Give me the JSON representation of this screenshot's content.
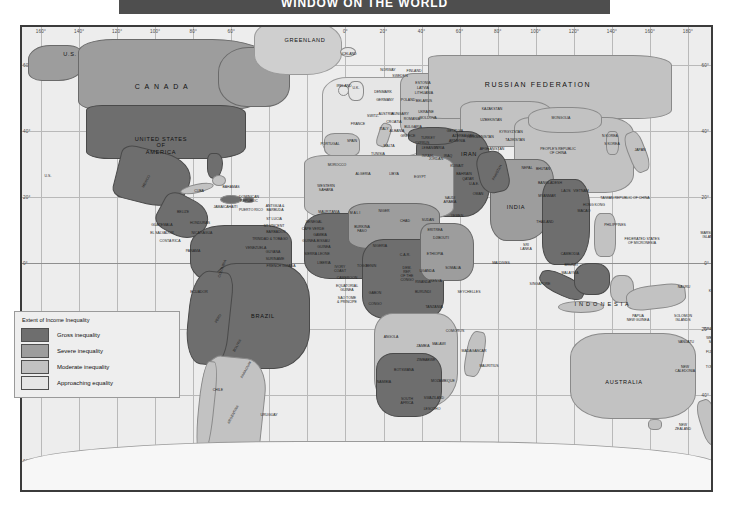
{
  "header": {
    "title": "WINDOW ON THE WORLD"
  },
  "legend": {
    "title": "Extent of Income Inequality",
    "items": [
      {
        "label": "Gross inequality",
        "color": "#6e6e6e"
      },
      {
        "label": "Severe inequality",
        "color": "#9d9d9d"
      },
      {
        "label": "Moderate inequality",
        "color": "#c2c2c2"
      },
      {
        "label": "Approaching equality",
        "color": "#e6e6e6"
      }
    ]
  },
  "graticule": {
    "longitudes": [
      "160°",
      "140°",
      "120°",
      "100°",
      "80°",
      "60°",
      "40°",
      "20°",
      "0°",
      "20°",
      "40°",
      "60°",
      "80°",
      "100°",
      "120°",
      "140°",
      "160°",
      "180°"
    ],
    "latitudes_left": [
      "60°",
      "40°",
      "20°",
      "0°",
      "20°",
      "40°",
      "60°"
    ],
    "latitudes_right": [
      "60°",
      "40°",
      "20°",
      "0°",
      "20°",
      "40°",
      "60°"
    ]
  },
  "map": {
    "labels": [
      {
        "t": "U.S.",
        "x": 48,
        "y": 27,
        "s": "mid"
      },
      {
        "t": "C A N A D A",
        "x": 140,
        "y": 60,
        "s": "big"
      },
      {
        "t": "GREENLAND",
        "x": 283,
        "y": 13,
        "s": "mid"
      },
      {
        "t": "ICELAND",
        "x": 327,
        "y": 28,
        "s": "tiny"
      },
      {
        "t": "UNITED STATES\nOF\nAMERICA",
        "x": 139,
        "y": 118,
        "s": "mid"
      },
      {
        "t": "U.S.",
        "x": 26,
        "y": 150,
        "s": "tiny"
      },
      {
        "t": "MEXICO",
        "x": 125,
        "y": 155,
        "s": "rot"
      },
      {
        "t": "CUBA",
        "x": 177,
        "y": 165,
        "s": "tiny"
      },
      {
        "t": "BAHAMAS",
        "x": 209,
        "y": 161,
        "s": "tiny"
      },
      {
        "t": "DOMINICAN\nREPUBLIC",
        "x": 227,
        "y": 173,
        "s": "tiny"
      },
      {
        "t": "PUERTO RICO",
        "x": 229,
        "y": 184,
        "s": "tiny"
      },
      {
        "t": "JAMAICA",
        "x": 199,
        "y": 181,
        "s": "tiny"
      },
      {
        "t": "HAITI",
        "x": 211,
        "y": 181,
        "s": "tiny"
      },
      {
        "t": "ANTIGUA &\nBARBUDA",
        "x": 253,
        "y": 182,
        "s": "tiny"
      },
      {
        "t": "BELIZE",
        "x": 161,
        "y": 186,
        "s": "tiny"
      },
      {
        "t": "GUATEMALA",
        "x": 140,
        "y": 199,
        "s": "tiny"
      },
      {
        "t": "HONDURAS",
        "x": 178,
        "y": 197,
        "s": "tiny"
      },
      {
        "t": "EL SALVADOR",
        "x": 140,
        "y": 207,
        "s": "tiny"
      },
      {
        "t": "NICARAGUA",
        "x": 180,
        "y": 207,
        "s": "tiny"
      },
      {
        "t": "COSTA RICA",
        "x": 148,
        "y": 215,
        "s": "tiny"
      },
      {
        "t": "ST LUCIA",
        "x": 252,
        "y": 193,
        "s": "tiny"
      },
      {
        "t": "ST VINCENT",
        "x": 252,
        "y": 200,
        "s": "tiny"
      },
      {
        "t": "BARBADOS",
        "x": 254,
        "y": 206,
        "s": "tiny"
      },
      {
        "t": "TRINIDAD & TOBAGO",
        "x": 248,
        "y": 213,
        "s": "tiny"
      },
      {
        "t": "PANAMA",
        "x": 171,
        "y": 225,
        "s": "tiny"
      },
      {
        "t": "VENEZUELA",
        "x": 234,
        "y": 222,
        "s": "tiny"
      },
      {
        "t": "GUYANA",
        "x": 251,
        "y": 226,
        "s": "tiny"
      },
      {
        "t": "SURINAME",
        "x": 253,
        "y": 233,
        "s": "tiny"
      },
      {
        "t": "FRENCH GUIANA",
        "x": 259,
        "y": 240,
        "s": "tiny"
      },
      {
        "t": "COLOMBIA",
        "x": 201,
        "y": 242,
        "s": "rot2"
      },
      {
        "t": "ECUADOR",
        "x": 177,
        "y": 266,
        "s": "tiny"
      },
      {
        "t": "PERU",
        "x": 197,
        "y": 292,
        "s": "rot"
      },
      {
        "t": "BRAZIL",
        "x": 241,
        "y": 289,
        "s": "mid"
      },
      {
        "t": "BOLIVIA",
        "x": 216,
        "y": 319,
        "s": "rot"
      },
      {
        "t": "PARAGUAY",
        "x": 225,
        "y": 343,
        "s": "rot"
      },
      {
        "t": "CHILE",
        "x": 196,
        "y": 364,
        "s": "tiny"
      },
      {
        "t": "ARGENTINA",
        "x": 212,
        "y": 388,
        "s": "rot"
      },
      {
        "t": "URUGUAY",
        "x": 247,
        "y": 389,
        "s": "tiny"
      },
      {
        "t": "PORTUGAL",
        "x": 308,
        "y": 118,
        "s": "tiny"
      },
      {
        "t": "SPAIN",
        "x": 330,
        "y": 115,
        "s": "tiny"
      },
      {
        "t": "FRANCE",
        "x": 336,
        "y": 98,
        "s": "tiny"
      },
      {
        "t": "IRELAND",
        "x": 322,
        "y": 60,
        "s": "tiny"
      },
      {
        "t": "U.K.",
        "x": 334,
        "y": 62,
        "s": "tiny"
      },
      {
        "t": "NORWAY",
        "x": 366,
        "y": 44,
        "s": "tiny"
      },
      {
        "t": "SWEDEN",
        "x": 378,
        "y": 50,
        "s": "tiny"
      },
      {
        "t": "FINLAND",
        "x": 392,
        "y": 45,
        "s": "tiny"
      },
      {
        "t": "ESTONIA",
        "x": 401,
        "y": 57,
        "s": "tiny"
      },
      {
        "t": "LATVIA",
        "x": 401,
        "y": 62,
        "s": "tiny"
      },
      {
        "t": "LITHUANIA",
        "x": 402,
        "y": 67,
        "s": "tiny"
      },
      {
        "t": "DENMARK",
        "x": 361,
        "y": 66,
        "s": "tiny"
      },
      {
        "t": "POLAND",
        "x": 386,
        "y": 74,
        "s": "tiny"
      },
      {
        "t": "GERMANY",
        "x": 363,
        "y": 74,
        "s": "tiny"
      },
      {
        "t": "BELARUS",
        "x": 402,
        "y": 75,
        "s": "tiny"
      },
      {
        "t": "UKRAINE",
        "x": 404,
        "y": 86,
        "s": "tiny"
      },
      {
        "t": "MOLDOVA",
        "x": 406,
        "y": 92,
        "s": "tiny"
      },
      {
        "t": "ROMANIA",
        "x": 390,
        "y": 93,
        "s": "tiny"
      },
      {
        "t": "HUNGARY",
        "x": 378,
        "y": 88,
        "s": "tiny"
      },
      {
        "t": "AUSTRIA",
        "x": 364,
        "y": 88,
        "s": "tiny"
      },
      {
        "t": "SWITZ.",
        "x": 351,
        "y": 90,
        "s": "tiny"
      },
      {
        "t": "ITALY",
        "x": 362,
        "y": 103,
        "s": "tiny"
      },
      {
        "t": "CROATIA",
        "x": 372,
        "y": 96,
        "s": "tiny"
      },
      {
        "t": "BULGARIA",
        "x": 391,
        "y": 101,
        "s": "tiny"
      },
      {
        "t": "GREECE",
        "x": 386,
        "y": 110,
        "s": "tiny"
      },
      {
        "t": "ALBANIA",
        "x": 375,
        "y": 105,
        "s": "tiny"
      },
      {
        "t": "MALTA",
        "x": 367,
        "y": 120,
        "s": "tiny"
      },
      {
        "t": "CYPRUS",
        "x": 400,
        "y": 117,
        "s": "tiny"
      },
      {
        "t": "TURKEY",
        "x": 406,
        "y": 112,
        "s": "tiny"
      },
      {
        "t": "SYRIA",
        "x": 417,
        "y": 122,
        "s": "tiny"
      },
      {
        "t": "LEBANON",
        "x": 408,
        "y": 122,
        "s": "tiny"
      },
      {
        "t": "ISRAEL",
        "x": 406,
        "y": 130,
        "s": "tiny"
      },
      {
        "t": "JORDAN",
        "x": 414,
        "y": 133,
        "s": "tiny"
      },
      {
        "t": "IRAQ",
        "x": 426,
        "y": 130,
        "s": "tiny"
      },
      {
        "t": "IRAN",
        "x": 447,
        "y": 127,
        "s": "mid"
      },
      {
        "t": "KUWAIT",
        "x": 435,
        "y": 140,
        "s": "tiny"
      },
      {
        "t": "BAHRAIN",
        "x": 442,
        "y": 148,
        "s": "tiny"
      },
      {
        "t": "QATAR",
        "x": 446,
        "y": 153,
        "s": "tiny"
      },
      {
        "t": "U.A.E.",
        "x": 452,
        "y": 158,
        "s": "tiny"
      },
      {
        "t": "SAUDI\nARABIA",
        "x": 428,
        "y": 174,
        "s": "tiny"
      },
      {
        "t": "OMAN",
        "x": 456,
        "y": 168,
        "s": "tiny"
      },
      {
        "t": "YEMEN",
        "x": 435,
        "y": 190,
        "s": "tiny"
      },
      {
        "t": "WESTERN\nSAHARA",
        "x": 304,
        "y": 162,
        "s": "tiny"
      },
      {
        "t": "ALGERIA",
        "x": 341,
        "y": 148,
        "s": "tiny"
      },
      {
        "t": "LIBYA",
        "x": 372,
        "y": 148,
        "s": "tiny"
      },
      {
        "t": "EGYPT",
        "x": 398,
        "y": 151,
        "s": "tiny"
      },
      {
        "t": "MOROCCO",
        "x": 315,
        "y": 139,
        "s": "tiny"
      },
      {
        "t": "TUNISIA",
        "x": 356,
        "y": 128,
        "s": "tiny"
      },
      {
        "t": "MAURITANIA",
        "x": 307,
        "y": 186,
        "s": "tiny"
      },
      {
        "t": "SENEGAL",
        "x": 292,
        "y": 196,
        "s": "tiny"
      },
      {
        "t": "CAPE VERDE",
        "x": 291,
        "y": 203,
        "s": "tiny"
      },
      {
        "t": "GAMBIA",
        "x": 298,
        "y": 209,
        "s": "tiny"
      },
      {
        "t": "GUINEA-BISSAU",
        "x": 294,
        "y": 215,
        "s": "tiny"
      },
      {
        "t": "GUINEA",
        "x": 302,
        "y": 221,
        "s": "tiny"
      },
      {
        "t": "SIERRA LEONE",
        "x": 295,
        "y": 228,
        "s": "tiny"
      },
      {
        "t": "LIBERIA",
        "x": 302,
        "y": 237,
        "s": "tiny"
      },
      {
        "t": "IVORY\nCOAST",
        "x": 318,
        "y": 243,
        "s": "tiny"
      },
      {
        "t": "M A L I",
        "x": 333,
        "y": 187,
        "s": "tiny"
      },
      {
        "t": "NIGER",
        "x": 362,
        "y": 185,
        "s": "tiny"
      },
      {
        "t": "BURKINA\nFASO",
        "x": 340,
        "y": 203,
        "s": "tiny"
      },
      {
        "t": "TOGO",
        "x": 340,
        "y": 240,
        "s": "tiny"
      },
      {
        "t": "BENIN",
        "x": 349,
        "y": 240,
        "s": "tiny"
      },
      {
        "t": "NIGERIA",
        "x": 358,
        "y": 220,
        "s": "tiny"
      },
      {
        "t": "CHAD",
        "x": 383,
        "y": 195,
        "s": "tiny"
      },
      {
        "t": "SUDAN",
        "x": 406,
        "y": 194,
        "s": "tiny"
      },
      {
        "t": "ERITREA",
        "x": 413,
        "y": 204,
        "s": "tiny"
      },
      {
        "t": "DJIBOUTI",
        "x": 419,
        "y": 212,
        "s": "tiny"
      },
      {
        "t": "ETHIOPIA",
        "x": 413,
        "y": 228,
        "s": "tiny"
      },
      {
        "t": "SOMALIA",
        "x": 431,
        "y": 242,
        "s": "tiny"
      },
      {
        "t": "C.A.R.",
        "x": 383,
        "y": 229,
        "s": "tiny"
      },
      {
        "t": "CAMEROON",
        "x": 325,
        "y": 252,
        "s": "tiny"
      },
      {
        "t": "EQUATORIAL\nGUINEA",
        "x": 325,
        "y": 262,
        "s": "tiny"
      },
      {
        "t": "SAO TOME\n& PRINCIPE",
        "x": 325,
        "y": 274,
        "s": "tiny"
      },
      {
        "t": "GABON",
        "x": 353,
        "y": 267,
        "s": "tiny"
      },
      {
        "t": "CONGO",
        "x": 353,
        "y": 278,
        "s": "tiny"
      },
      {
        "t": "DEM.\nREP.\nOF THE\nCONGO",
        "x": 385,
        "y": 248,
        "s": "tiny"
      },
      {
        "t": "UGANDA",
        "x": 405,
        "y": 245,
        "s": "tiny"
      },
      {
        "t": "RWANDA",
        "x": 401,
        "y": 256,
        "s": "tiny"
      },
      {
        "t": "BURUNDI",
        "x": 401,
        "y": 266,
        "s": "tiny"
      },
      {
        "t": "KENYA",
        "x": 414,
        "y": 255,
        "s": "tiny"
      },
      {
        "t": "TANZANIA",
        "x": 412,
        "y": 281,
        "s": "tiny"
      },
      {
        "t": "SEYCHELLES",
        "x": 447,
        "y": 266,
        "s": "tiny"
      },
      {
        "t": "COMOROS",
        "x": 433,
        "y": 305,
        "s": "tiny"
      },
      {
        "t": "ANGOLA",
        "x": 369,
        "y": 311,
        "s": "tiny"
      },
      {
        "t": "ZAMBIA",
        "x": 401,
        "y": 320,
        "s": "tiny"
      },
      {
        "t": "MALAWI",
        "x": 417,
        "y": 318,
        "s": "tiny"
      },
      {
        "t": "MADAGASCAR",
        "x": 452,
        "y": 325,
        "s": "tiny"
      },
      {
        "t": "MAURITIUS",
        "x": 467,
        "y": 340,
        "s": "tiny"
      },
      {
        "t": "ZIMBABWE",
        "x": 404,
        "y": 334,
        "s": "tiny"
      },
      {
        "t": "BOTSWANA",
        "x": 382,
        "y": 344,
        "s": "tiny"
      },
      {
        "t": "NAMIBIA",
        "x": 362,
        "y": 356,
        "s": "tiny"
      },
      {
        "t": "MOZAMBIQUE",
        "x": 421,
        "y": 355,
        "s": "tiny"
      },
      {
        "t": "SWAZILAND",
        "x": 412,
        "y": 372,
        "s": "tiny"
      },
      {
        "t": "SOUTH\nAFRICA",
        "x": 385,
        "y": 375,
        "s": "tiny"
      },
      {
        "t": "LESOTHO",
        "x": 410,
        "y": 383,
        "s": "tiny"
      },
      {
        "t": "RUSSIAN  FEDERATION",
        "x": 516,
        "y": 58,
        "s": "big"
      },
      {
        "t": "KAZAKSTAN",
        "x": 470,
        "y": 83,
        "s": "tiny"
      },
      {
        "t": "UZBEKISTAN",
        "x": 469,
        "y": 94,
        "s": "tiny"
      },
      {
        "t": "TURKMENISTAN",
        "x": 458,
        "y": 111,
        "s": "tiny"
      },
      {
        "t": "KYRGYZSTAN",
        "x": 489,
        "y": 106,
        "s": "tiny"
      },
      {
        "t": "TAJIKISTAN",
        "x": 493,
        "y": 114,
        "s": "tiny"
      },
      {
        "t": "AZERBAIJAN",
        "x": 441,
        "y": 110,
        "s": "tiny"
      },
      {
        "t": "ARMENIA",
        "x": 435,
        "y": 115,
        "s": "tiny"
      },
      {
        "t": "GEORGIA",
        "x": 433,
        "y": 105,
        "s": "tiny"
      },
      {
        "t": "MONGOLIA",
        "x": 539,
        "y": 92,
        "s": "tiny"
      },
      {
        "t": "PEOPLE'S REPUBLIC\nOF CHINA",
        "x": 536,
        "y": 125,
        "s": "tiny"
      },
      {
        "t": "N KOREA",
        "x": 588,
        "y": 110,
        "s": "tiny"
      },
      {
        "t": "S KOREA",
        "x": 590,
        "y": 118,
        "s": "tiny"
      },
      {
        "t": "JAPAN",
        "x": 618,
        "y": 124,
        "s": "tiny"
      },
      {
        "t": "AFGHANISTAN",
        "x": 470,
        "y": 123,
        "s": "tiny"
      },
      {
        "t": "PAKISTAN",
        "x": 476,
        "y": 146,
        "s": "rot"
      },
      {
        "t": "NEPAL",
        "x": 505,
        "y": 142,
        "s": "tiny"
      },
      {
        "t": "BHUTAN",
        "x": 521,
        "y": 143,
        "s": "tiny"
      },
      {
        "t": "INDIA",
        "x": 494,
        "y": 180,
        "s": "mid"
      },
      {
        "t": "BANGLADESH",
        "x": 528,
        "y": 157,
        "s": "tiny"
      },
      {
        "t": "MYANMAR",
        "x": 525,
        "y": 170,
        "s": "tiny"
      },
      {
        "t": "SRI\nLANKA",
        "x": 504,
        "y": 221,
        "s": "tiny"
      },
      {
        "t": "MALDIVES",
        "x": 479,
        "y": 237,
        "s": "tiny"
      },
      {
        "t": "THAILAND",
        "x": 523,
        "y": 196,
        "s": "tiny"
      },
      {
        "t": "LAOS",
        "x": 544,
        "y": 165,
        "s": "tiny"
      },
      {
        "t": "VIETNAM",
        "x": 559,
        "y": 165,
        "s": "tiny"
      },
      {
        "t": "CAMBODIA",
        "x": 548,
        "y": 228,
        "s": "tiny"
      },
      {
        "t": "MALAYSIA",
        "x": 548,
        "y": 247,
        "s": "tiny"
      },
      {
        "t": "BRUNEI",
        "x": 549,
        "y": 239,
        "s": "tiny"
      },
      {
        "t": "SINGAPORE",
        "x": 518,
        "y": 258,
        "s": "tiny"
      },
      {
        "t": "I N D O N E S I A",
        "x": 580,
        "y": 277,
        "s": "mid"
      },
      {
        "t": "PHILIPPINES",
        "x": 593,
        "y": 199,
        "s": "tiny"
      },
      {
        "t": "TAIWAN REPUBLIC OF CHINA",
        "x": 603,
        "y": 172,
        "s": "tiny"
      },
      {
        "t": "HONG KONG",
        "x": 572,
        "y": 179,
        "s": "tiny"
      },
      {
        "t": "MACAO",
        "x": 562,
        "y": 185,
        "s": "tiny"
      },
      {
        "t": "FEDERATED STATES\nOF MICRONESIA",
        "x": 620,
        "y": 215,
        "s": "tiny"
      },
      {
        "t": "MARSHALL\nISLANDS",
        "x": 688,
        "y": 209,
        "s": "tiny"
      },
      {
        "t": "NAURU",
        "x": 662,
        "y": 261,
        "s": "tiny"
      },
      {
        "t": "KIRIBATI",
        "x": 694,
        "y": 265,
        "s": "tiny"
      },
      {
        "t": "PAPUA\nNEW GUINEA",
        "x": 616,
        "y": 292,
        "s": "tiny"
      },
      {
        "t": "SOLOMON\nISLANDS",
        "x": 661,
        "y": 292,
        "s": "tiny"
      },
      {
        "t": "VANUATU",
        "x": 664,
        "y": 316,
        "s": "tiny"
      },
      {
        "t": "TUVALU",
        "x": 688,
        "y": 303,
        "s": "tiny"
      },
      {
        "t": "WESTERN\nSAMOA",
        "x": 693,
        "y": 314,
        "s": "tiny"
      },
      {
        "t": "FIJI",
        "x": 687,
        "y": 326,
        "s": "tiny"
      },
      {
        "t": "TONGA",
        "x": 690,
        "y": 341,
        "s": "tiny"
      },
      {
        "t": "NEW\nCALEDONIA",
        "x": 663,
        "y": 343,
        "s": "tiny"
      },
      {
        "t": "AUSTRALIA",
        "x": 602,
        "y": 355,
        "s": "mid"
      },
      {
        "t": "NEW\nZEALAND",
        "x": 661,
        "y": 401,
        "s": "tiny"
      },
      {
        "t": "A N T A R C T I C A",
        "x": 378,
        "y": 470,
        "s": "mid"
      }
    ]
  }
}
